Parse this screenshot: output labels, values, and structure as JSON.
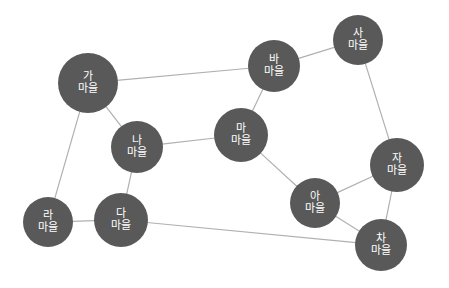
{
  "diagram": {
    "type": "undirected-node-link-graph",
    "background_color": "#ffffff",
    "node_color": "#595959",
    "node_text_color": "#ffffff",
    "edge_color": "#b0b0b0",
    "edge_width": 1.2,
    "node_font_size": 11,
    "width": 449,
    "height": 288,
    "nodes": [
      {
        "id": "ga",
        "label": "가 마을",
        "line1": "가",
        "line2": "마을",
        "x": 88,
        "y": 83,
        "r": 30
      },
      {
        "id": "na",
        "label": "나 마을",
        "line1": "나",
        "line2": "마을",
        "x": 137,
        "y": 147,
        "r": 26
      },
      {
        "id": "da",
        "label": "다 마을",
        "line1": "다",
        "line2": "마을",
        "x": 121,
        "y": 220,
        "r": 27
      },
      {
        "id": "ra",
        "label": "라 마을",
        "line1": "라",
        "line2": "마을",
        "x": 48,
        "y": 222,
        "r": 25
      },
      {
        "id": "ma",
        "label": "마 마을",
        "line1": "마",
        "line2": "마을",
        "x": 241,
        "y": 135,
        "r": 27
      },
      {
        "id": "ba",
        "label": "바 마을",
        "line1": "바",
        "line2": "마을",
        "x": 274,
        "y": 66,
        "r": 26
      },
      {
        "id": "sa",
        "label": "사 마을",
        "line1": "사",
        "line2": "마을",
        "x": 358,
        "y": 40,
        "r": 25
      },
      {
        "id": "a",
        "label": "아 마을",
        "line1": "아",
        "line2": "마을",
        "x": 315,
        "y": 203,
        "r": 25
      },
      {
        "id": "ja",
        "label": "자 마을",
        "line1": "자",
        "line2": "마을",
        "x": 397,
        "y": 165,
        "r": 27
      },
      {
        "id": "cha",
        "label": "차 마을",
        "line1": "차",
        "line2": "마을",
        "x": 381,
        "y": 245,
        "r": 26
      }
    ],
    "edges": [
      {
        "from": "ga",
        "to": "na",
        "name": "edge-ga-na"
      },
      {
        "from": "ga",
        "to": "ra",
        "name": "edge-ga-ra"
      },
      {
        "from": "ga",
        "to": "ba",
        "name": "edge-ga-ba"
      },
      {
        "from": "na",
        "to": "da",
        "name": "edge-na-da"
      },
      {
        "from": "na",
        "to": "ma",
        "name": "edge-na-ma"
      },
      {
        "from": "ra",
        "to": "da",
        "name": "edge-ra-da"
      },
      {
        "from": "da",
        "to": "cha",
        "name": "edge-da-cha"
      },
      {
        "from": "ba",
        "to": "ma",
        "name": "edge-ba-ma"
      },
      {
        "from": "ba",
        "to": "sa",
        "name": "edge-ba-sa"
      },
      {
        "from": "ma",
        "to": "a",
        "name": "edge-ma-a"
      },
      {
        "from": "sa",
        "to": "ja",
        "name": "edge-sa-ja"
      },
      {
        "from": "a",
        "to": "ja",
        "name": "edge-a-ja"
      },
      {
        "from": "a",
        "to": "cha",
        "name": "edge-a-cha"
      },
      {
        "from": "ja",
        "to": "cha",
        "name": "edge-ja-cha"
      }
    ]
  }
}
